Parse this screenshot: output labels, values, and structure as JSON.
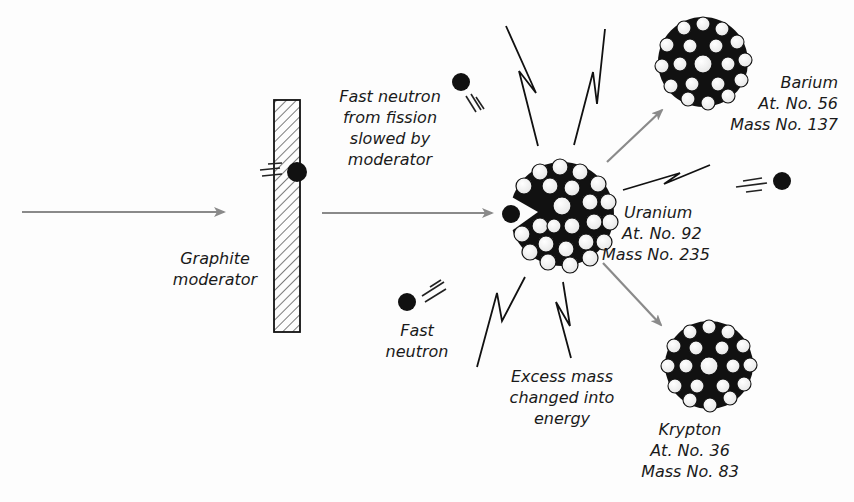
{
  "diagram": {
    "type": "nuclear-fission",
    "colors": {
      "arrow": "#8a8a8a",
      "ink": "#111111",
      "background": "#fdfdfd"
    }
  },
  "labels": {
    "fast_neutron_from_fission": [
      "Fast neutron",
      "from fission",
      "slowed by",
      "moderator"
    ],
    "graphite_moderator": [
      "Graphite",
      "moderator"
    ],
    "fast_neutron": [
      "Fast",
      "neutron"
    ],
    "excess_mass": [
      "Excess mass",
      "changed into",
      "energy"
    ]
  },
  "nuclei": {
    "barium": {
      "name": "Barium",
      "atomic": "At. No. 56",
      "mass": "Mass No. 137"
    },
    "uranium": {
      "name": "Uranium",
      "atomic": "At. No. 92",
      "mass": "Mass  No. 235"
    },
    "krypton": {
      "name": "Krypton",
      "atomic": "At. No. 36",
      "mass": "Mass No. 83"
    }
  }
}
